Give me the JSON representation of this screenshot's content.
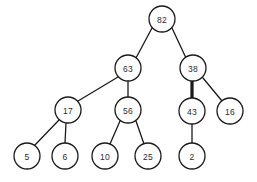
{
  "diagram": {
    "type": "binary-tree",
    "background_color": "#ffffff",
    "node_fill": "#ffffff",
    "node_stroke": "#1a1a1a",
    "edge_color": "#1a1a1a",
    "text_color": "#2b2b2b",
    "node_radius": 13,
    "width": 257,
    "height": 182
  },
  "nodes": [
    {
      "id": "n82",
      "label": "82",
      "cx": 162,
      "cy": 19,
      "level": 0
    },
    {
      "id": "n63",
      "label": "63",
      "cx": 128,
      "cy": 68,
      "level": 1
    },
    {
      "id": "n38",
      "label": "38",
      "cx": 193,
      "cy": 68,
      "level": 1
    },
    {
      "id": "n17",
      "label": "17",
      "cx": 68,
      "cy": 110,
      "level": 2
    },
    {
      "id": "n56",
      "label": "56",
      "cx": 128,
      "cy": 110,
      "level": 2
    },
    {
      "id": "n43",
      "label": "43",
      "cx": 192,
      "cy": 111,
      "level": 2
    },
    {
      "id": "n16",
      "label": "16",
      "cx": 230,
      "cy": 111,
      "level": 2
    },
    {
      "id": "n5",
      "label": "5",
      "cx": 27,
      "cy": 156,
      "level": 3
    },
    {
      "id": "n6",
      "label": "6",
      "cx": 65,
      "cy": 156,
      "level": 3
    },
    {
      "id": "n10",
      "label": "10",
      "cx": 105,
      "cy": 156,
      "level": 3
    },
    {
      "id": "n25",
      "label": "25",
      "cx": 148,
      "cy": 156,
      "level": 3
    },
    {
      "id": "n2",
      "label": "2",
      "cx": 192,
      "cy": 156,
      "level": 3
    }
  ],
  "edges": [
    {
      "id": "e1",
      "from": "n82",
      "to": "n63",
      "x1": 152,
      "y1": 28,
      "x2": 136,
      "y2": 58,
      "bold": false
    },
    {
      "id": "e2",
      "from": "n82",
      "to": "n38",
      "x1": 172,
      "y1": 28,
      "x2": 186,
      "y2": 58,
      "bold": false
    },
    {
      "id": "e3",
      "from": "n63",
      "to": "n17",
      "x1": 118,
      "y1": 77,
      "x2": 78,
      "y2": 101,
      "bold": false
    },
    {
      "id": "e4",
      "from": "n63",
      "to": "n56",
      "x1": 128,
      "y1": 81,
      "x2": 128,
      "y2": 97,
      "bold": false
    },
    {
      "id": "e5",
      "from": "n38",
      "to": "n43",
      "x1": 192,
      "y1": 81,
      "x2": 192,
      "y2": 98,
      "bold": true
    },
    {
      "id": "e6",
      "from": "n38",
      "to": "n16",
      "x1": 203,
      "y1": 78,
      "x2": 222,
      "y2": 101,
      "bold": false
    },
    {
      "id": "e7",
      "from": "n17",
      "to": "n5",
      "x1": 59,
      "y1": 120,
      "x2": 34,
      "y2": 146,
      "bold": false
    },
    {
      "id": "e8",
      "from": "n17",
      "to": "n6",
      "x1": 66,
      "y1": 123,
      "x2": 65,
      "y2": 143,
      "bold": false
    },
    {
      "id": "e9",
      "from": "n56",
      "to": "n10",
      "x1": 120,
      "y1": 121,
      "x2": 110,
      "y2": 144,
      "bold": false
    },
    {
      "id": "e10",
      "from": "n56",
      "to": "n25",
      "x1": 136,
      "y1": 121,
      "x2": 144,
      "y2": 144,
      "bold": false
    },
    {
      "id": "e11",
      "from": "n43",
      "to": "n2",
      "x1": 192,
      "y1": 124,
      "x2": 192,
      "y2": 143,
      "bold": false
    }
  ]
}
